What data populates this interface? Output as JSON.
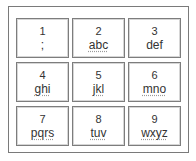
{
  "keypad": {
    "keys": [
      {
        "digit": "1",
        "letters": ";"
      },
      {
        "digit": "2",
        "letters": "abc"
      },
      {
        "digit": "3",
        "letters": "def"
      },
      {
        "digit": "4",
        "letters": "ghi"
      },
      {
        "digit": "5",
        "letters": "jkl"
      },
      {
        "digit": "6",
        "letters": "mno"
      },
      {
        "digit": "7",
        "letters": "pqrs"
      },
      {
        "digit": "8",
        "letters": "tuv"
      },
      {
        "digit": "9",
        "letters": "wxyz"
      }
    ]
  },
  "colors": {
    "border": "#7d7d7d",
    "text": "#333333",
    "background": "#ffffff"
  }
}
